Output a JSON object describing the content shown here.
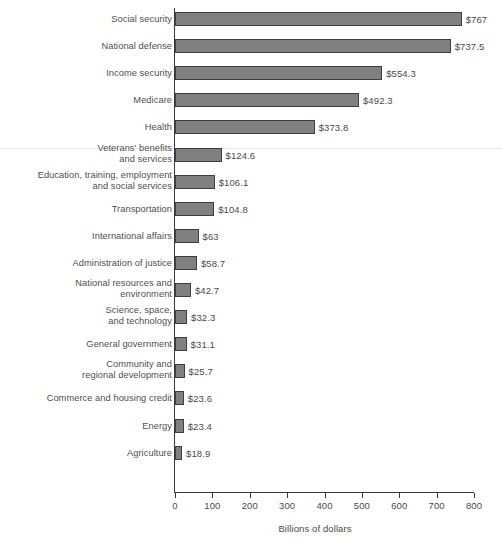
{
  "chart_data": {
    "type": "bar",
    "orientation": "horizontal",
    "title": "",
    "xlabel": "Billions of dollars",
    "ylabel": "",
    "xlim": [
      0,
      800
    ],
    "xticks": [
      0,
      100,
      200,
      300,
      400,
      500,
      600,
      700,
      800
    ],
    "xtick_labels": [
      "0",
      "100",
      "200",
      "300",
      "400",
      "500",
      "600",
      "700",
      "800"
    ],
    "grid": false,
    "legend": false,
    "bar_color": "#808080",
    "bar_border_color": "#3f3f3f",
    "axis_color": "#3a3a3a",
    "text_color": "#4a4a4a",
    "categories": [
      "Social security",
      "National defense",
      "Income security",
      "Medicare",
      "Health",
      "Veterans' benefits and services",
      "Education, training, employment and social services",
      "Transportation",
      "International affairs",
      "Administration of justice",
      "National resources and environment",
      "Science, space, and technology",
      "General government",
      "Community and regional development",
      "Commerce and housing credit",
      "Energy",
      "Agriculture"
    ],
    "values": [
      767,
      737.5,
      554.3,
      492.3,
      373.8,
      124.6,
      106.1,
      104.8,
      63,
      58.7,
      42.7,
      32.3,
      31.1,
      25.7,
      23.6,
      23.4,
      18.9
    ],
    "value_labels": [
      "$767",
      "$737.5",
      "$554.3",
      "$492.3",
      "$373.8",
      "$124.6",
      "$106.1",
      "$104.8",
      "$63",
      "$58.7",
      "$42.7",
      "$32.3",
      "$31.1",
      "$25.7",
      "$23.6",
      "$23.4",
      "$18.9"
    ],
    "category_label_lines": [
      [
        "Social security"
      ],
      [
        "National defense"
      ],
      [
        "Income security"
      ],
      [
        "Medicare"
      ],
      [
        "Health"
      ],
      [
        "Veterans' benefits",
        "and services"
      ],
      [
        "Education, training, employment",
        "and social services"
      ],
      [
        "Transportation"
      ],
      [
        "International affairs"
      ],
      [
        "Administration of justice"
      ],
      [
        "National resources and",
        "environment"
      ],
      [
        "Science, space,",
        "and technology"
      ],
      [
        "General government"
      ],
      [
        "Community and",
        "regional development"
      ],
      [
        "Commerce and housing credit"
      ],
      [
        "Energy"
      ],
      [
        "Agriculture"
      ]
    ]
  }
}
